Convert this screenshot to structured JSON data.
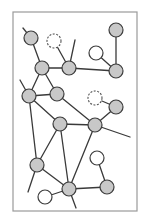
{
  "diagram": {
    "type": "network-graph",
    "frame": {
      "x": 13,
      "y": 12,
      "width": 124,
      "height": 199
    },
    "node_radius": 7,
    "colors": {
      "filled": "#c8c8c8",
      "stroke": "#3c3c3c",
      "empty": "#ffffff",
      "frame": "#9a9a9a"
    },
    "nodes": [
      {
        "id": "A",
        "x": 31,
        "y": 38,
        "style": "gray"
      },
      {
        "id": "B",
        "x": 54,
        "y": 41,
        "style": "dashed"
      },
      {
        "id": "C",
        "x": 42,
        "y": 68,
        "style": "gray"
      },
      {
        "id": "D",
        "x": 69,
        "y": 68,
        "style": "gray"
      },
      {
        "id": "E",
        "x": 96,
        "y": 53,
        "style": "white"
      },
      {
        "id": "F",
        "x": 116,
        "y": 30,
        "style": "gray"
      },
      {
        "id": "G",
        "x": 116,
        "y": 71,
        "style": "gray"
      },
      {
        "id": "H",
        "x": 29,
        "y": 96,
        "style": "gray"
      },
      {
        "id": "I",
        "x": 57,
        "y": 94,
        "style": "gray"
      },
      {
        "id": "J",
        "x": 95,
        "y": 98,
        "style": "dashed"
      },
      {
        "id": "K",
        "x": 116,
        "y": 107,
        "style": "gray"
      },
      {
        "id": "L",
        "x": 60,
        "y": 124,
        "style": "gray"
      },
      {
        "id": "M",
        "x": 95,
        "y": 125,
        "style": "gray"
      },
      {
        "id": "N",
        "x": 37,
        "y": 165,
        "style": "gray"
      },
      {
        "id": "O",
        "x": 97,
        "y": 158,
        "style": "white"
      },
      {
        "id": "P",
        "x": 69,
        "y": 189,
        "style": "gray"
      },
      {
        "id": "Q",
        "x": 45,
        "y": 197,
        "style": "white"
      },
      {
        "id": "R",
        "x": 107,
        "y": 187,
        "style": "gray"
      }
    ],
    "edges": [
      {
        "from": "A",
        "to": "C"
      },
      {
        "from": "B",
        "to": "D"
      },
      {
        "from": "C",
        "to": "D"
      },
      {
        "from": "D",
        "to": "G"
      },
      {
        "from": "E",
        "to": "G"
      },
      {
        "from": "F",
        "to": "G"
      },
      {
        "from": "C",
        "to": "H"
      },
      {
        "from": "C",
        "to": "I"
      },
      {
        "from": "H",
        "to": "I"
      },
      {
        "from": "H",
        "to": "L"
      },
      {
        "from": "H",
        "to": "N"
      },
      {
        "from": "I",
        "to": "M"
      },
      {
        "from": "J",
        "to": "K"
      },
      {
        "from": "K",
        "to": "M"
      },
      {
        "from": "L",
        "to": "M"
      },
      {
        "from": "L",
        "to": "N"
      },
      {
        "from": "L",
        "to": "P"
      },
      {
        "from": "M",
        "to": "P"
      },
      {
        "from": "N",
        "to": "P"
      },
      {
        "from": "O",
        "to": "R"
      },
      {
        "from": "P",
        "to": "R"
      },
      {
        "from": "Q",
        "to": "P"
      }
    ],
    "stubs": [
      {
        "from": "A",
        "x2": 23,
        "y2": 28
      },
      {
        "from": "D",
        "x2": 75,
        "y2": 40
      },
      {
        "from": "H",
        "x2": 20,
        "y2": 80
      },
      {
        "from": "M",
        "x2": 130,
        "y2": 137
      },
      {
        "from": "N",
        "x2": 28,
        "y2": 192
      },
      {
        "from": "P",
        "x2": 76,
        "y2": 208
      }
    ]
  }
}
